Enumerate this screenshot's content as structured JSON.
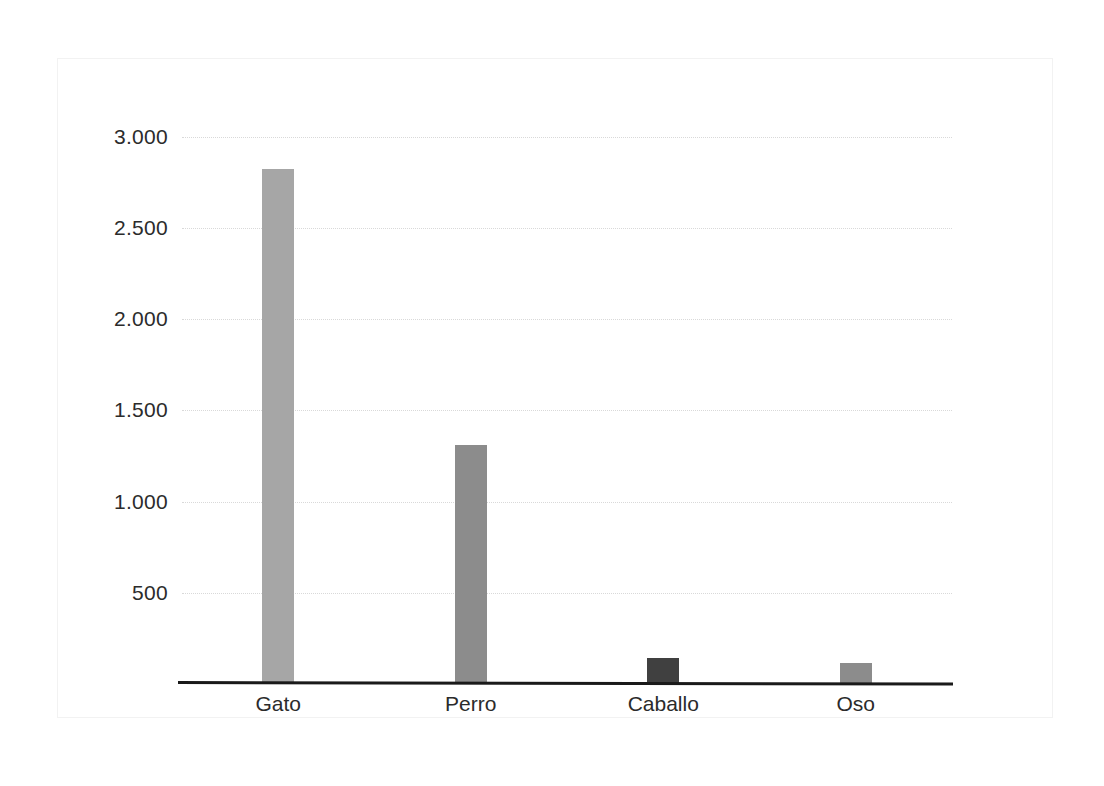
{
  "chart_data": {
    "type": "bar",
    "title": "",
    "subtitle": "",
    "xlabel": "",
    "ylabel": "",
    "categories": [
      "Gato",
      "Perro",
      "Caballo",
      "Oso"
    ],
    "values": [
      2820,
      1310,
      140,
      115
    ],
    "series": [
      {
        "name": "",
        "values": [
          2820,
          1310,
          140,
          115
        ]
      }
    ],
    "bar_colors": [
      "#a6a6a6",
      "#8c8c8c",
      "#404040",
      "#8c8c8c"
    ],
    "ytick_labels": [
      "3.000",
      "2.500",
      "2.000",
      "1.500",
      "1.000",
      "500"
    ],
    "ytick_values": [
      3000,
      2500,
      2000,
      1500,
      1000,
      500
    ],
    "ylim": [
      0,
      3200
    ],
    "grid": "horizontal-dotted",
    "gridline_color": "#d9d9d9",
    "legend": "none",
    "axis_line_color": "#1a1a1a",
    "background": "#ffffff",
    "annotations": [],
    "number_format": "period-thousands-separator"
  }
}
